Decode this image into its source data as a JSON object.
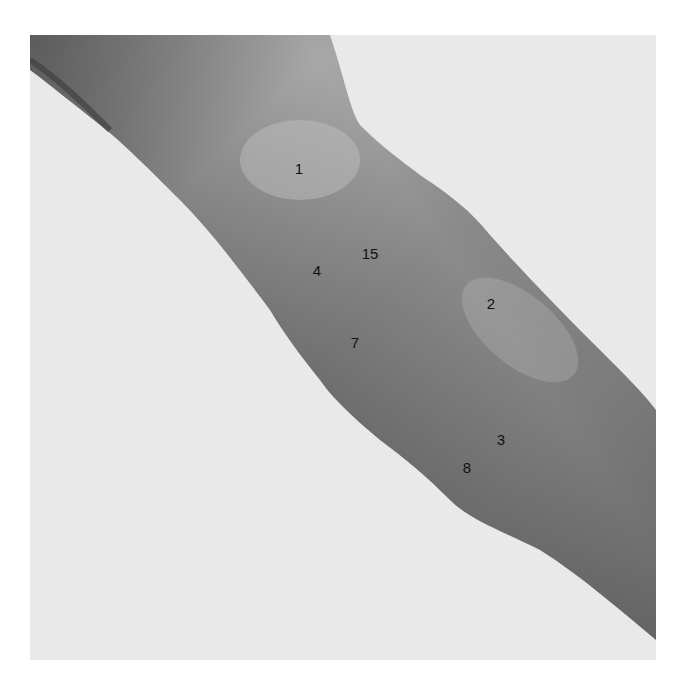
{
  "image": {
    "subject": "anatomical photograph of a human arm (grayscale)",
    "background_color": "#e9e9e9",
    "skin_color_light": "#b4b4b4",
    "skin_color_dark": "#6e6e6e"
  },
  "labels": [
    {
      "text": "1",
      "x": 299,
      "y": 168
    },
    {
      "text": "15",
      "x": 370,
      "y": 253
    },
    {
      "text": "4",
      "x": 317,
      "y": 270
    },
    {
      "text": "2",
      "x": 491,
      "y": 303
    },
    {
      "text": "7",
      "x": 355,
      "y": 342
    },
    {
      "text": "3",
      "x": 501,
      "y": 439
    },
    {
      "text": "8",
      "x": 467,
      "y": 467
    }
  ]
}
